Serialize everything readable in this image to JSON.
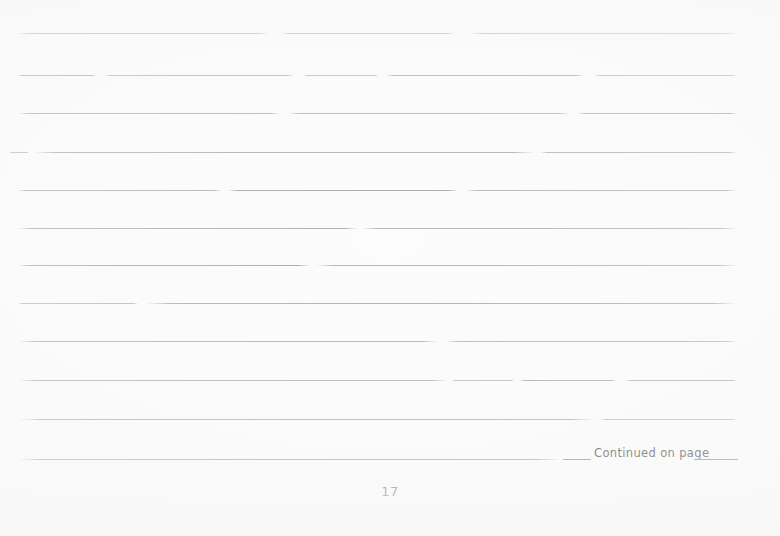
{
  "document": {
    "kind": "scanned-notebook-page",
    "page_number": "17",
    "background_color": "#fcfcfc",
    "rule_color": "#9a9a9e",
    "text_color": "#4a4a4c"
  },
  "footer": {
    "continued_label": "Continued on page",
    "has_leading_blank_rule": true,
    "has_trailing_blank_rule": true
  },
  "ruled_lines": [
    {
      "index": 1,
      "y": 33,
      "x_start": 18,
      "x_end": 737,
      "segments": [
        {
          "x": 18,
          "w": 250,
          "opacity": 0.85
        },
        {
          "x": 282,
          "w": 172,
          "opacity": 0.78
        },
        {
          "x": 470,
          "w": 267,
          "opacity": 0.72
        }
      ]
    },
    {
      "index": 2,
      "y": 75,
      "x_start": 18,
      "x_end": 737,
      "segments": [
        {
          "x": 18,
          "w": 78,
          "opacity": 0.8
        },
        {
          "x": 104,
          "w": 190,
          "opacity": 0.74
        },
        {
          "x": 304,
          "w": 74,
          "opacity": 0.66
        },
        {
          "x": 386,
          "w": 198,
          "opacity": 0.8
        },
        {
          "x": 594,
          "w": 143,
          "opacity": 0.7
        }
      ]
    },
    {
      "index": 3,
      "y": 113,
      "x_start": 18,
      "x_end": 737,
      "segments": [
        {
          "x": 18,
          "w": 262,
          "opacity": 0.8
        },
        {
          "x": 288,
          "w": 282,
          "opacity": 0.74
        },
        {
          "x": 578,
          "w": 159,
          "opacity": 0.78
        }
      ]
    },
    {
      "index": 4,
      "y": 152,
      "x_start": 10,
      "x_end": 737,
      "segments": [
        {
          "x": 10,
          "w": 18,
          "opacity": 0.7
        },
        {
          "x": 34,
          "w": 500,
          "opacity": 0.8
        },
        {
          "x": 540,
          "w": 197,
          "opacity": 0.74
        }
      ]
    },
    {
      "index": 5,
      "y": 190,
      "x_start": 18,
      "x_end": 737,
      "segments": [
        {
          "x": 18,
          "w": 204,
          "opacity": 0.78
        },
        {
          "x": 228,
          "w": 230,
          "opacity": 0.86
        },
        {
          "x": 466,
          "w": 271,
          "opacity": 0.74
        }
      ]
    },
    {
      "index": 6,
      "y": 228,
      "x_start": 18,
      "x_end": 737,
      "segments": [
        {
          "x": 18,
          "w": 340,
          "opacity": 0.8
        },
        {
          "x": 362,
          "w": 375,
          "opacity": 0.74
        }
      ]
    },
    {
      "index": 7,
      "y": 265,
      "x_start": 18,
      "x_end": 737,
      "segments": [
        {
          "x": 18,
          "w": 292,
          "opacity": 0.86
        },
        {
          "x": 316,
          "w": 421,
          "opacity": 0.74
        }
      ]
    },
    {
      "index": 8,
      "y": 303,
      "x_start": 18,
      "x_end": 737,
      "segments": [
        {
          "x": 18,
          "w": 120,
          "opacity": 0.7
        },
        {
          "x": 146,
          "w": 591,
          "opacity": 0.8
        }
      ]
    },
    {
      "index": 9,
      "y": 341,
      "x_start": 18,
      "x_end": 737,
      "segments": [
        {
          "x": 18,
          "w": 420,
          "opacity": 0.8
        },
        {
          "x": 446,
          "w": 291,
          "opacity": 0.74
        }
      ]
    },
    {
      "index": 10,
      "y": 380,
      "x_start": 18,
      "x_end": 737,
      "segments": [
        {
          "x": 18,
          "w": 430,
          "opacity": 0.8
        },
        {
          "x": 452,
          "w": 62,
          "opacity": 0.66
        },
        {
          "x": 520,
          "w": 96,
          "opacity": 0.86
        },
        {
          "x": 626,
          "w": 111,
          "opacity": 0.78
        }
      ]
    },
    {
      "index": 11,
      "y": 419,
      "x_start": 18,
      "x_end": 737,
      "segments": [
        {
          "x": 18,
          "w": 576,
          "opacity": 0.8
        },
        {
          "x": 600,
          "w": 137,
          "opacity": 0.7
        }
      ]
    },
    {
      "index": 12,
      "y": 459,
      "x_start": 18,
      "x_end": 560,
      "segments": [
        {
          "x": 18,
          "w": 542,
          "opacity": 0.8
        }
      ]
    },
    {
      "index": 13,
      "y": 459,
      "x_start": 694,
      "x_end": 737,
      "segments": [
        {
          "x": 694,
          "w": 43,
          "opacity": 0.78
        }
      ]
    }
  ]
}
